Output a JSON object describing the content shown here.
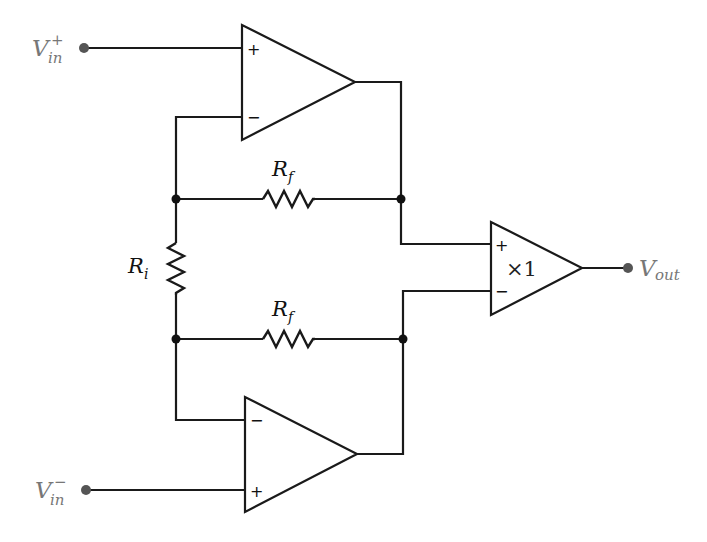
{
  "diagram": {
    "type": "circuit",
    "colors": {
      "wire": "#1a1a1a",
      "terminal": "#555555",
      "terminal_label": "#777777"
    },
    "terminals": {
      "vin_plus": {
        "base": "V",
        "sup": "+",
        "sub": "in"
      },
      "vin_minus": {
        "base": "V",
        "sup": "−",
        "sub": "in"
      },
      "vout": {
        "base": "V",
        "sub": "out"
      }
    },
    "opamps": [
      {
        "id": "top",
        "plus": "+",
        "minus": "−"
      },
      {
        "id": "bottom",
        "plus": "+",
        "minus": "−"
      },
      {
        "id": "buffer",
        "plus": "+",
        "minus": "−",
        "gain_label": "×1"
      }
    ],
    "resistors": {
      "rf_top": {
        "base": "R",
        "sub": "f"
      },
      "rf_bottom": {
        "base": "R",
        "sub": "f"
      },
      "ri": {
        "base": "R",
        "sub": "i"
      }
    }
  }
}
